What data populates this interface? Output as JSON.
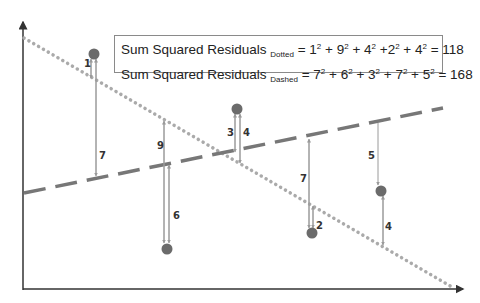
{
  "legend": {
    "dotted": {
      "prefix": "Sum Squared Residuals ",
      "subscript": "Dotted",
      "terms": [
        "1",
        "9",
        "4",
        "2",
        "4"
      ],
      "result": "118"
    },
    "dashed": {
      "prefix": "Sum Squared Residuals ",
      "subscript": "Dashed",
      "terms": [
        "7",
        "6",
        "3",
        "7",
        "5"
      ],
      "result": "168"
    }
  },
  "colors": {
    "point": "#6b6b6b",
    "dashed_line": "#777777",
    "dotted_line": "#aaaaaa",
    "arrow": "#9a9a9a",
    "axis": "#333333",
    "box_border": "#8a8a8a"
  },
  "points": [
    {
      "x": 94,
      "y": 54,
      "dotted_residual": "1",
      "dashed_residual": "7"
    },
    {
      "x": 167,
      "y": 249,
      "dotted_residual": "9",
      "dashed_residual": "6"
    },
    {
      "x": 237,
      "y": 109,
      "dotted_residual": "4",
      "dashed_residual": "3"
    },
    {
      "x": 312,
      "y": 233,
      "dotted_residual": "2",
      "dashed_residual": "7"
    },
    {
      "x": 381,
      "y": 191,
      "dotted_residual": "4",
      "dashed_residual": "5"
    }
  ],
  "labels": [
    {
      "text": "1",
      "x": 84,
      "y": 58
    },
    {
      "text": "7",
      "x": 99,
      "y": 150
    },
    {
      "text": "9",
      "x": 157,
      "y": 140
    },
    {
      "text": "6",
      "x": 173,
      "y": 210
    },
    {
      "text": "3",
      "x": 227,
      "y": 127
    },
    {
      "text": "4",
      "x": 243,
      "y": 127
    },
    {
      "text": "7",
      "x": 300,
      "y": 173
    },
    {
      "text": "2",
      "x": 316,
      "y": 220
    },
    {
      "text": "5",
      "x": 368,
      "y": 150
    },
    {
      "text": "4",
      "x": 385,
      "y": 221
    }
  ]
}
